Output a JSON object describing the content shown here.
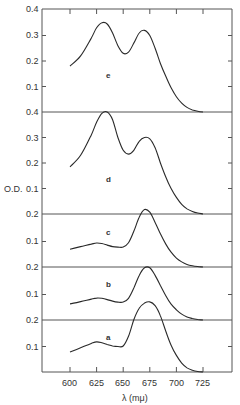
{
  "chart_data": {
    "type": "line",
    "title": "",
    "xlabel": "λ (mμ)",
    "ylabel": "O.D.",
    "x_ticks": [
      600,
      625,
      650,
      675,
      700,
      725
    ],
    "xlim": [
      577,
      755
    ],
    "grid": false,
    "legend": "none; panels labeled a–e inline",
    "layout": "vertically stacked offset panels, each with its own 0-based O.D. scale",
    "x": [
      600,
      610,
      620,
      625,
      630,
      635,
      640,
      645,
      650,
      655,
      660,
      665,
      670,
      675,
      680,
      685,
      690,
      695,
      700,
      705,
      710,
      715,
      720,
      725
    ],
    "series": [
      {
        "name": "e",
        "panel_y_ticks": [
          "0.1",
          "0.2",
          "0.3",
          "0.4"
        ],
        "values": [
          0.18,
          0.22,
          0.29,
          0.33,
          0.35,
          0.345,
          0.31,
          0.26,
          0.23,
          0.235,
          0.27,
          0.31,
          0.32,
          0.3,
          0.25,
          0.19,
          0.14,
          0.095,
          0.06,
          0.035,
          0.018,
          0.008,
          0.003,
          0.0
        ]
      },
      {
        "name": "d",
        "panel_y_ticks": [
          "0.1",
          "0.2",
          "0.3",
          "0.4"
        ],
        "values": [
          0.185,
          0.23,
          0.31,
          0.36,
          0.395,
          0.4,
          0.37,
          0.3,
          0.25,
          0.235,
          0.25,
          0.285,
          0.3,
          0.295,
          0.26,
          0.2,
          0.145,
          0.1,
          0.065,
          0.038,
          0.02,
          0.01,
          0.004,
          0.0
        ]
      },
      {
        "name": "c",
        "panel_y_ticks": [
          "0.1",
          "0.2"
        ],
        "values": [
          0.07,
          0.08,
          0.09,
          0.094,
          0.092,
          0.086,
          0.08,
          0.078,
          0.078,
          0.095,
          0.14,
          0.195,
          0.225,
          0.215,
          0.175,
          0.13,
          0.09,
          0.058,
          0.035,
          0.02,
          0.01,
          0.005,
          0.002,
          0.0
        ]
      },
      {
        "name": "b",
        "panel_y_ticks": [
          "0.1",
          "0.2"
        ],
        "values": [
          0.063,
          0.072,
          0.082,
          0.086,
          0.085,
          0.08,
          0.074,
          0.07,
          0.07,
          0.085,
          0.125,
          0.175,
          0.205,
          0.205,
          0.175,
          0.135,
          0.095,
          0.062,
          0.04,
          0.023,
          0.012,
          0.006,
          0.002,
          0.0
        ]
      },
      {
        "name": "a",
        "panel_y_ticks": [
          "0.1",
          "0.2"
        ],
        "values": [
          0.078,
          0.095,
          0.112,
          0.118,
          0.115,
          0.108,
          0.102,
          0.1,
          0.102,
          0.14,
          0.205,
          0.25,
          0.27,
          0.275,
          0.26,
          0.22,
          0.16,
          0.105,
          0.065,
          0.035,
          0.016,
          0.007,
          0.002,
          0.0
        ]
      }
    ]
  },
  "labels": {
    "y_axis_title": "O.D.",
    "x_axis_title": "λ (mμ)",
    "x_tick_labels": [
      "600",
      "625",
      "650",
      "675",
      "700",
      "725"
    ],
    "panel_e": {
      "label": "e",
      "ticks": [
        "0.4",
        "0.3",
        "0.2",
        "0.1"
      ]
    },
    "panel_d": {
      "label": "d",
      "ticks": [
        "0.4",
        "0.3",
        "0.2",
        "0.1"
      ]
    },
    "panel_c": {
      "label": "c",
      "ticks": [
        "0.2",
        "0.1"
      ]
    },
    "panel_b": {
      "label": "b",
      "ticks": [
        "0.2",
        "0.1"
      ]
    },
    "panel_a": {
      "label": "a",
      "ticks": [
        "0.2",
        "0.1"
      ]
    }
  }
}
